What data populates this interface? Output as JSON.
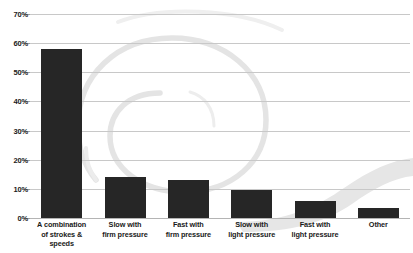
{
  "chart_data": {
    "type": "bar",
    "title": "",
    "subtitle": "",
    "xlabel": "",
    "ylabel": "",
    "categories": [
      "A combination of strokes & speeds",
      "Slow with firm pressure",
      "Fast with firm pressure",
      "Slow with light pressure",
      "Fast with light pressure",
      "Other"
    ],
    "category_lines": [
      [
        "A combination",
        "of strokes &",
        "speeds"
      ],
      [
        "Slow with",
        "firm pressure"
      ],
      [
        "Fast with",
        "firm pressure"
      ],
      [
        "Slow with",
        "light pressure"
      ],
      [
        "Fast with",
        "light pressure"
      ],
      [
        "Other"
      ]
    ],
    "values": [
      58,
      14,
      13,
      9.5,
      6,
      3.5
    ],
    "value_labels": [
      "58%",
      "14%",
      "13%",
      "9.5%",
      "6%",
      "3.5%"
    ],
    "ylim": [
      0,
      70
    ],
    "ytick_step": 10,
    "ytick_labels": [
      "0%",
      "10%",
      "20%",
      "30%",
      "40%",
      "50%",
      "60%",
      "70%"
    ],
    "ytick_values": [
      0,
      10,
      20,
      30,
      40,
      50,
      60,
      70
    ],
    "grid": true,
    "grid_axis": "y",
    "legend": false,
    "legend_position": "none",
    "bar_color": "#262626",
    "grid_color": "#c8c8c8",
    "axis_color": "#b4b4b4",
    "background_color": "#ffffff",
    "watermark_color": "#e2e2e2",
    "watermark_shapes": [
      "spiral-swirl",
      "tapering-swoosh-band"
    ]
  }
}
